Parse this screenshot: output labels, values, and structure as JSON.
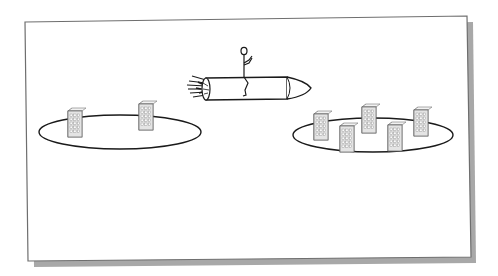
{
  "diagram": {
    "type": "clipart-illustration",
    "colors": {
      "background": "#ffffff",
      "frame_border": "#6e6e6e",
      "frame_shadow": "#9a9a9a",
      "line": "#1a1a1a",
      "building_front": "#d9d9d9",
      "building_side": "#efefef",
      "building_window": "#ffffff"
    },
    "elements": {
      "left_island": {
        "label": "",
        "building_count": 2
      },
      "right_island": {
        "label": "",
        "building_count": 5
      },
      "rocket": {
        "label": "",
        "rider": "stick-figure"
      }
    }
  }
}
